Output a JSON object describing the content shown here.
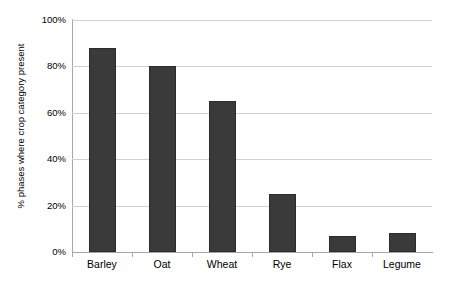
{
  "chart_data": {
    "type": "bar",
    "title": "",
    "subtitle": "",
    "xlabel": "",
    "ylabel": "% phases where crop category present",
    "categories": [
      "Barley",
      "Oat",
      "Wheat",
      "Rye",
      "Flax",
      "Legume"
    ],
    "values": [
      88,
      80,
      65,
      25,
      7,
      8
    ],
    "ylim": [
      0,
      100
    ],
    "y_ticks": [
      0,
      20,
      40,
      60,
      80,
      100
    ],
    "y_tick_labels": [
      "0%",
      "20%",
      "40%",
      "60%",
      "80%",
      "100%"
    ],
    "grid": true,
    "legend": false,
    "legend_position": "none",
    "colors": {
      "bar": "#3a3a3a",
      "bar_edge": "#2b2b2b",
      "gridline": "#d0d0d0",
      "axis": "#a6a6a6",
      "text": "#000000",
      "background": "#ffffff"
    }
  }
}
